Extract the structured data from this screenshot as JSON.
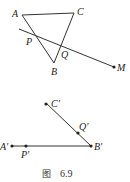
{
  "figure": {
    "caption_prefix": "图",
    "caption_number": "6.9"
  },
  "top_diagram": {
    "labels": {
      "A": "A",
      "B": "B",
      "C": "C",
      "P": "P",
      "Q": "Q",
      "M": "M"
    },
    "description": "Triangle ABC cut by a line through P (on AB) and Q (on BC) ending at point M"
  },
  "bottom_diagram": {
    "labels": {
      "A_prime": "A′",
      "B_prime": "B′",
      "C_prime": "C′",
      "P_prime": "P′",
      "Q_prime": "Q′"
    },
    "description": "Unfolded: segment A′B′ with P′ on it, segment B′C′ with Q′ on it"
  },
  "colors": {
    "line": "#333333",
    "text": "#222222",
    "background": "#ffffff"
  }
}
